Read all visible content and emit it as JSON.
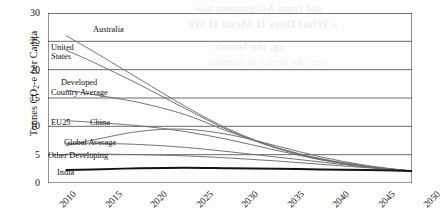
{
  "chart_data": {
    "type": "line",
    "title": "",
    "xlabel": "",
    "ylabel": "Tonnes CO2-e per Capita",
    "ylabel_parts": {
      "pre": "Tonnes CO",
      "sub": "2",
      "post": "-e per Capita"
    },
    "xlim": [
      2010,
      2050
    ],
    "ylim": [
      0,
      30
    ],
    "yticks": [
      0,
      5,
      10,
      15,
      20,
      25,
      30
    ],
    "xticks": [
      2010,
      2015,
      2020,
      2025,
      2030,
      2035,
      2040,
      2045,
      2050
    ],
    "grid": "horizontal",
    "legend": "inline-labels",
    "x": [
      2012,
      2015,
      2020,
      2025,
      2030,
      2035,
      2040,
      2045,
      2050
    ],
    "series": [
      {
        "name": "Australia",
        "values": [
          26.0,
          23.2,
          18.4,
          13.6,
          9.4,
          6.3,
          4.2,
          2.9,
          2.1
        ]
      },
      {
        "name": "United States",
        "values": [
          23.4,
          21.3,
          17.4,
          13.2,
          9.2,
          6.2,
          4.1,
          2.9,
          2.1
        ]
      },
      {
        "name": "Developed Country Average",
        "values": [
          16.4,
          15.6,
          14.2,
          12.1,
          9.0,
          6.3,
          4.3,
          3.0,
          2.1
        ]
      },
      {
        "name": "EU25",
        "values": [
          11.0,
          10.7,
          10.1,
          9.1,
          7.6,
          5.8,
          4.1,
          2.9,
          2.1
        ]
      },
      {
        "name": "China",
        "values": [
          6.6,
          7.6,
          9.1,
          9.5,
          8.5,
          6.6,
          4.6,
          3.1,
          2.1
        ]
      },
      {
        "name": "Global Average",
        "values": [
          7.0,
          7.0,
          6.8,
          6.3,
          5.5,
          4.6,
          3.7,
          2.8,
          2.1
        ]
      },
      {
        "name": "Other Developing",
        "values": [
          5.1,
          5.1,
          5.0,
          4.8,
          4.4,
          3.9,
          3.3,
          2.7,
          2.1
        ]
      },
      {
        "name": "India",
        "values": [
          2.3,
          2.4,
          2.6,
          2.7,
          2.6,
          2.5,
          2.4,
          2.3,
          2.1
        ]
      }
    ],
    "series_labels": [
      {
        "text": "Australia",
        "x": 93,
        "y": 25
      },
      {
        "text": "United",
        "x": 51,
        "y": 43
      },
      {
        "text": "States",
        "x": 51,
        "y": 52
      },
      {
        "text": "Developed",
        "x": 61,
        "y": 78
      },
      {
        "text": "Country Average",
        "x": 51,
        "y": 88
      },
      {
        "text": "EU25",
        "x": 51,
        "y": 118
      },
      {
        "text": "China",
        "x": 90,
        "y": 118
      },
      {
        "text": "Global Average",
        "x": 64,
        "y": 138
      },
      {
        "text": "Other Developing",
        "x": 48,
        "y": 151
      },
      {
        "text": "India",
        "x": 57,
        "y": 168
      }
    ]
  },
  "bleed_text": {
    "line1": "old from Assignment has",
    "line2": "s  What Does It Mean If We",
    "line3": "eg. the Woods",
    "line4": "one: the stretch of dramatic"
  }
}
